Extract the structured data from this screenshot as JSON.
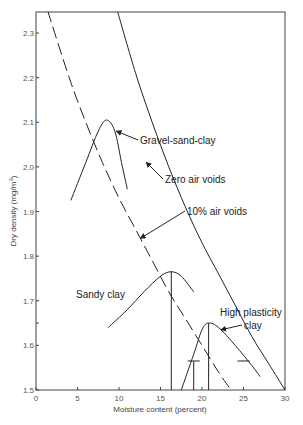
{
  "chart_data": {
    "type": "line",
    "title": "",
    "xlabel": "Moisture content (percent)",
    "ylabel": "Dry density (mg/m³)",
    "xlim": [
      0,
      30
    ],
    "ylim": [
      1.5,
      2.35
    ],
    "grid": false,
    "x_ticks": [
      0,
      5,
      10,
      15,
      20,
      25,
      30
    ],
    "y_ticks": [
      1.5,
      1.6,
      1.7,
      1.8,
      1.9,
      2.0,
      2.1,
      2.2,
      2.3
    ],
    "series": [
      {
        "name": "Zero air voids",
        "style": "solid",
        "x": [
          9.8,
          12,
          14,
          16,
          18,
          20,
          22,
          24,
          26,
          28,
          30
        ],
        "y": [
          2.35,
          2.21,
          2.1,
          2.0,
          1.91,
          1.83,
          1.76,
          1.69,
          1.62,
          1.56,
          1.5
        ]
      },
      {
        "name": "10% air voids",
        "style": "dashed",
        "x": [
          1.4,
          4,
          6,
          8,
          10,
          12,
          14,
          16,
          18,
          20,
          22,
          23.5
        ],
        "y": [
          2.35,
          2.2,
          2.1,
          2.01,
          1.93,
          1.86,
          1.79,
          1.72,
          1.66,
          1.6,
          1.54,
          1.5
        ]
      },
      {
        "name": "Gravel-sand-clay",
        "style": "solid",
        "x": [
          4.2,
          6,
          7.5,
          8.5,
          9.5,
          10.3,
          11
        ],
        "y": [
          1.925,
          2.01,
          2.08,
          2.105,
          2.08,
          2.01,
          1.95
        ],
        "peak": {
          "x": 8.5,
          "y": 2.105
        }
      },
      {
        "name": "Sandy clay",
        "style": "solid",
        "x": [
          8.7,
          11,
          13,
          15,
          16.3,
          17.5,
          19
        ],
        "y": [
          1.64,
          1.68,
          1.72,
          1.755,
          1.765,
          1.755,
          1.72
        ],
        "peak": {
          "x": 16.3,
          "y": 1.765
        }
      },
      {
        "name": "High plasticity clay",
        "style": "solid",
        "x": [
          17.5,
          19,
          20,
          20.8,
          22,
          24,
          26,
          27
        ],
        "y": [
          1.5,
          1.58,
          1.635,
          1.65,
          1.64,
          1.6,
          1.555,
          1.53
        ],
        "peak": {
          "x": 20.8,
          "y": 1.65
        }
      }
    ],
    "reference_lines": [
      {
        "type": "vertical",
        "x": 16.3,
        "y_from": 1.5,
        "y_to": 1.765
      },
      {
        "type": "vertical",
        "x": 20.8,
        "y_from": 1.5,
        "y_to": 1.65
      },
      {
        "type": "vertical",
        "x": 19.0,
        "y_from": 1.5,
        "y_to": 1.565
      },
      {
        "type": "horizontal_tick",
        "x": 19.0,
        "y": 1.565
      },
      {
        "type": "horizontal_tick",
        "x": 25.0,
        "y": 1.565
      }
    ],
    "annotations": [
      {
        "text": "Gravel-sand-clay",
        "x": 12.5,
        "y": 2.115,
        "arrow_to": {
          "x": 9.7,
          "y": 2.08
        }
      },
      {
        "text": "Zero air voids",
        "x": 15.5,
        "y": 2.03,
        "arrow_to": {
          "x": 13.3,
          "y": 2.01
        }
      },
      {
        "text": "10% air voids",
        "x": 18.5,
        "y": 1.91,
        "arrow_to": {
          "x": 12.6,
          "y": 1.84
        }
      },
      {
        "text": "Sandy clay",
        "x": 5.0,
        "y": 1.72
      },
      {
        "text": "High plasticity clay",
        "x": 23.6,
        "y": 1.655,
        "arrow_to": {
          "x": 22.3,
          "y": 1.635
        }
      }
    ]
  },
  "labels": {
    "xlabel": "Moisture content (percent)",
    "ylabel_main": "Dry density (mg/m",
    "ylabel_sup": "3",
    "ylabel_end": ")",
    "ann_gravel": "Gravel-sand-clay",
    "ann_zero": "Zero air voids",
    "ann_ten": "10% air voids",
    "ann_sandy": "Sandy clay",
    "ann_hpc_1": "High plasticity",
    "ann_hpc_2": "clay"
  }
}
